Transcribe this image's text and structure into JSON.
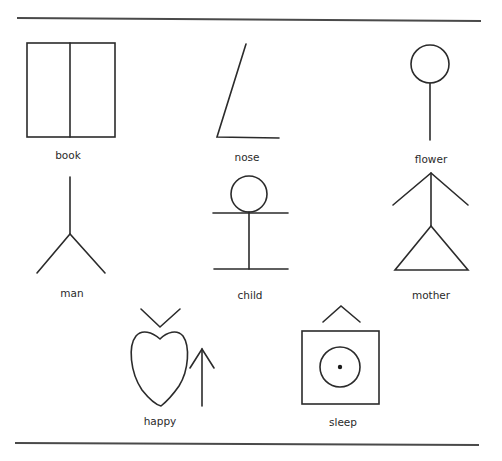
{
  "figure": {
    "symbols": [
      {
        "id": "book",
        "label": "book"
      },
      {
        "id": "nose",
        "label": "nose"
      },
      {
        "id": "flower",
        "label": "flower"
      },
      {
        "id": "man",
        "label": "man"
      },
      {
        "id": "child",
        "label": "child"
      },
      {
        "id": "mother",
        "label": "mother"
      },
      {
        "id": "happy",
        "label": "happy"
      },
      {
        "id": "sleep",
        "label": "sleep"
      }
    ]
  },
  "colors": {
    "ink": "#2b2b2b",
    "rule": "#4a4a4a",
    "background": "#ffffff"
  }
}
